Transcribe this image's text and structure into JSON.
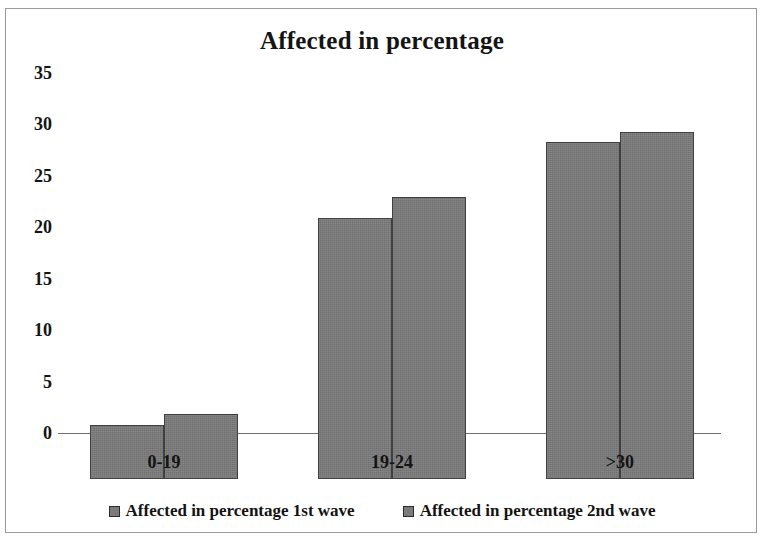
{
  "chart_data": {
    "type": "bar",
    "title": "Affected in percentage",
    "xlabel": "",
    "ylabel": "",
    "categories": [
      "0-19",
      "19-24",
      ">30"
    ],
    "series": [
      {
        "name": "Affected in percentage 1st wave",
        "values": [
          5,
          24,
          31
        ],
        "color": "#7b7b7b"
      },
      {
        "name": "Affected in percentage 2nd wave",
        "values": [
          6,
          26,
          32
        ],
        "color": "#7b7b7b"
      }
    ],
    "ylim": [
      0,
      35
    ],
    "y_ticks": [
      0,
      5,
      10,
      15,
      20,
      25,
      30,
      35
    ],
    "y_tick_labels": [
      "0",
      "5",
      "10",
      "15",
      "20",
      "25",
      "30",
      "35"
    ],
    "grid": false,
    "legend_position": "bottom",
    "legend": [
      {
        "label": "Affected in percentage 1st wave",
        "marker": "square-swatch"
      },
      {
        "label": "Affected in percentage 2nd wave",
        "marker": "square-swatch"
      }
    ],
    "frame_border_color": "#9a9a9a",
    "axis_color": "#6e6e6e",
    "bar_border_color": "#404040",
    "text_color": "#141414"
  }
}
